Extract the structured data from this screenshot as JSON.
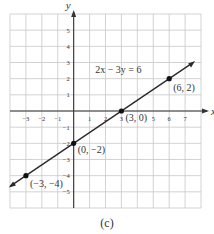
{
  "chart_data": {
    "type": "line",
    "title": "",
    "xlabel": "x",
    "ylabel": "y",
    "xlim": [
      -4,
      8
    ],
    "ylim": [
      -6,
      6
    ],
    "grid": true,
    "x_ticks": [
      -3,
      -2,
      -1,
      1,
      2,
      3,
      5,
      6,
      7
    ],
    "y_ticks": [
      5,
      4,
      3,
      2,
      1,
      -1,
      -2,
      -3,
      -4,
      -5
    ],
    "equation": "2x − 3y = 6",
    "series": [
      {
        "name": "2x − 3y = 6",
        "line_from": [
          -4,
          -4.667
        ],
        "line_to": [
          8,
          3.333
        ],
        "points": [
          {
            "x": -3,
            "y": -4,
            "label": "(−3, −4)"
          },
          {
            "x": 0,
            "y": -2,
            "label": "(0, −2)"
          },
          {
            "x": 3,
            "y": 0,
            "label": "(3, 0)"
          },
          {
            "x": 6,
            "y": 2,
            "label": "(6, 2)"
          }
        ]
      }
    ]
  },
  "caption": "(c)",
  "colors": {
    "grid": "#c8c8c8",
    "axis": "#333333",
    "line": "#2a2a2a",
    "point": "#111111",
    "text": "#333333"
  }
}
